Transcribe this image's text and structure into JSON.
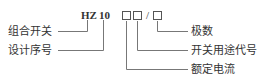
{
  "diagram": {
    "model_prefix": "HZ",
    "model_series": "10",
    "separator": "/",
    "left_labels": {
      "switch_type": "组合开关",
      "design_number": "设计序号"
    },
    "right_labels": {
      "poles": "极数",
      "purpose_code": "开关用途代号",
      "rated_current": "额定电流"
    },
    "line_color": "#666666"
  }
}
